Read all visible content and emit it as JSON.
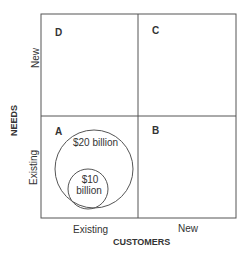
{
  "diagram": {
    "quadrants": {
      "top_left": "D",
      "top_right": "C",
      "bottom_left": "A",
      "bottom_right": "B"
    },
    "y_axis": {
      "title": "NEEDS",
      "ticks": [
        "New",
        "Existing"
      ]
    },
    "x_axis": {
      "title": "CUSTOMERS",
      "ticks": [
        "Existing",
        "New"
      ]
    },
    "circles": {
      "large": "$20 billion",
      "small_line1": "$10",
      "small_line2": "billion"
    }
  }
}
